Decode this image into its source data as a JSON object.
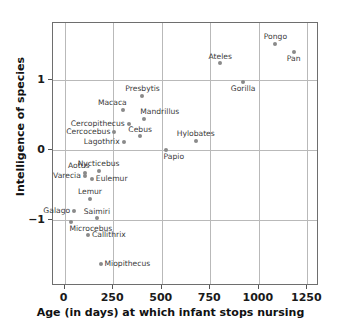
{
  "chart_data": {
    "type": "scatter",
    "title": "",
    "xlabel": "Age (in days) at which infant stops nursing",
    "ylabel": "Intelligence of species",
    "xlim": [
      -60,
      1310
    ],
    "ylim": [
      -1.95,
      1.82
    ],
    "xticks": [
      0,
      250,
      500,
      750,
      1000,
      1250
    ],
    "xticklabels": [
      "0",
      "250",
      "500",
      "750",
      "1000",
      "1250"
    ],
    "yticks": [
      1,
      0,
      -1
    ],
    "yticklabels": [
      "1",
      "0",
      "−1"
    ],
    "grid": true,
    "legend": null,
    "points": [
      {
        "label": "Pongo",
        "x": 1085,
        "y": 1.52,
        "label_pos": "above"
      },
      {
        "label": "Pan",
        "x": 1180,
        "y": 1.4,
        "label_pos": "below"
      },
      {
        "label": "Ateles",
        "x": 800,
        "y": 1.24,
        "label_pos": "above"
      },
      {
        "label": "Gorilla",
        "x": 920,
        "y": 0.97,
        "label_pos": "below"
      },
      {
        "label": "Presbytis",
        "x": 400,
        "y": 0.78,
        "label_pos": "above"
      },
      {
        "label": "Macaca",
        "x": 300,
        "y": 0.58,
        "label_pos": "above-left"
      },
      {
        "label": "Mandrillus",
        "x": 410,
        "y": 0.45,
        "label_pos": "above-right"
      },
      {
        "label": "Cercopithecus",
        "x": 330,
        "y": 0.37,
        "label_pos": "left"
      },
      {
        "label": "Cercocebus",
        "x": 255,
        "y": 0.26,
        "label_pos": "left"
      },
      {
        "label": "Cebus",
        "x": 390,
        "y": 0.2,
        "label_pos": "above"
      },
      {
        "label": "Lagothrix",
        "x": 305,
        "y": 0.12,
        "label_pos": "left"
      },
      {
        "label": "Hylobates",
        "x": 675,
        "y": 0.13,
        "label_pos": "above"
      },
      {
        "label": "Papio",
        "x": 520,
        "y": 0.0,
        "label_pos": "below-right"
      },
      {
        "label": "Nycticebus",
        "x": 175,
        "y": -0.3,
        "label_pos": "above"
      },
      {
        "label": "Aotus",
        "x": 105,
        "y": -0.33,
        "label_pos": "above-left"
      },
      {
        "label": "Varecia",
        "x": 105,
        "y": -0.37,
        "label_pos": "left"
      },
      {
        "label": "Eulemur",
        "x": 140,
        "y": -0.41,
        "label_pos": "right"
      },
      {
        "label": "Lemur",
        "x": 130,
        "y": -0.7,
        "label_pos": "above"
      },
      {
        "label": "Galago",
        "x": 50,
        "y": -0.88,
        "label_pos": "left"
      },
      {
        "label": "Saimiri",
        "x": 165,
        "y": -0.98,
        "label_pos": "above"
      },
      {
        "label": "Microcebus",
        "x": 35,
        "y": -1.03,
        "label_pos": "below-right"
      },
      {
        "label": "Callithrix",
        "x": 120,
        "y": -1.22,
        "label_pos": "right"
      },
      {
        "label": "Miopithecus",
        "x": 185,
        "y": -1.63,
        "label_pos": "right"
      }
    ],
    "colors": {
      "point": "#8a8a8a",
      "grid": "#b9b9b9",
      "frame": "#6e6e6e",
      "label_text": "#3a3a3a",
      "axis_text": "#111111",
      "background": "#ffffff"
    }
  }
}
